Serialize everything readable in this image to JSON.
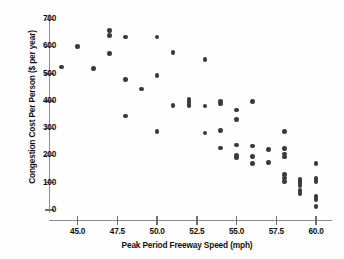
{
  "chart_data": {
    "type": "scatter",
    "title": "",
    "xlabel": "Peak Period Freeway Speed (mph)",
    "ylabel": "Congestion Cost Per Person ($ per year)",
    "xlim": [
      43.2,
      61.0
    ],
    "ylim": [
      -35,
      720
    ],
    "grid": false,
    "legend": null,
    "xticks": [
      45.0,
      47.5,
      50.0,
      52.5,
      55.0,
      57.5,
      60.0
    ],
    "xtick_labels": [
      "45.0",
      "47.5",
      "50.0",
      "52.5",
      "55.0",
      "57.5",
      "60.0"
    ],
    "yticks": [
      0,
      100,
      200,
      300,
      400,
      500,
      600,
      700
    ],
    "ytick_labels": [
      "0",
      "100",
      "200",
      "300",
      "400",
      "500",
      "600",
      "700"
    ],
    "marker": {
      "shape": "circle",
      "color": "#3a3a3a",
      "size": 4.6
    },
    "points": [
      {
        "x": 44.0,
        "y": 525
      },
      {
        "x": 45.0,
        "y": 600
      },
      {
        "x": 46.0,
        "y": 520
      },
      {
        "x": 47.0,
        "y": 660
      },
      {
        "x": 47.0,
        "y": 640
      },
      {
        "x": 47.0,
        "y": 575
      },
      {
        "x": 48.0,
        "y": 635
      },
      {
        "x": 48.0,
        "y": 480
      },
      {
        "x": 48.0,
        "y": 345
      },
      {
        "x": 49.0,
        "y": 445
      },
      {
        "x": 50.0,
        "y": 635
      },
      {
        "x": 50.0,
        "y": 495
      },
      {
        "x": 50.0,
        "y": 288
      },
      {
        "x": 51.0,
        "y": 578
      },
      {
        "x": 51.0,
        "y": 383
      },
      {
        "x": 52.0,
        "y": 408
      },
      {
        "x": 52.0,
        "y": 398
      },
      {
        "x": 52.0,
        "y": 390
      },
      {
        "x": 52.0,
        "y": 383
      },
      {
        "x": 53.0,
        "y": 552
      },
      {
        "x": 53.0,
        "y": 382
      },
      {
        "x": 53.0,
        "y": 283
      },
      {
        "x": 54.0,
        "y": 398
      },
      {
        "x": 54.0,
        "y": 390
      },
      {
        "x": 54.0,
        "y": 292
      },
      {
        "x": 54.0,
        "y": 228
      },
      {
        "x": 55.0,
        "y": 368
      },
      {
        "x": 55.0,
        "y": 332
      },
      {
        "x": 55.0,
        "y": 238
      },
      {
        "x": 55.0,
        "y": 200
      },
      {
        "x": 55.0,
        "y": 192
      },
      {
        "x": 56.0,
        "y": 398
      },
      {
        "x": 56.0,
        "y": 235
      },
      {
        "x": 56.0,
        "y": 197
      },
      {
        "x": 56.0,
        "y": 170
      },
      {
        "x": 57.0,
        "y": 222
      },
      {
        "x": 57.0,
        "y": 175
      },
      {
        "x": 58.0,
        "y": 288
      },
      {
        "x": 58.0,
        "y": 225
      },
      {
        "x": 58.0,
        "y": 205
      },
      {
        "x": 58.0,
        "y": 195
      },
      {
        "x": 58.0,
        "y": 130
      },
      {
        "x": 58.0,
        "y": 118
      },
      {
        "x": 58.0,
        "y": 105
      },
      {
        "x": 59.0,
        "y": 112
      },
      {
        "x": 59.0,
        "y": 105
      },
      {
        "x": 59.0,
        "y": 98
      },
      {
        "x": 59.0,
        "y": 88
      },
      {
        "x": 59.0,
        "y": 72
      },
      {
        "x": 59.0,
        "y": 60
      },
      {
        "x": 60.0,
        "y": 170
      },
      {
        "x": 60.0,
        "y": 115
      },
      {
        "x": 60.0,
        "y": 105
      },
      {
        "x": 60.0,
        "y": 50
      },
      {
        "x": 60.0,
        "y": 38
      },
      {
        "x": 60.0,
        "y": 12
      }
    ]
  }
}
